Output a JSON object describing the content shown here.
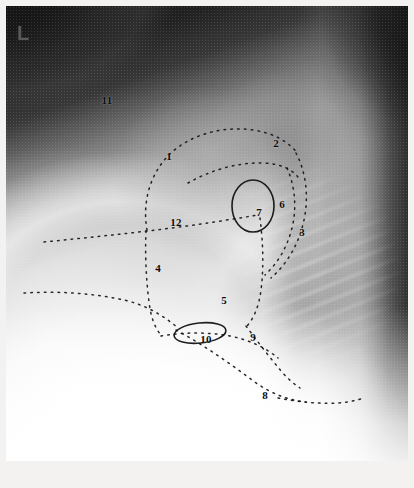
{
  "figure": {
    "modality": "radiograph",
    "view": "lateral chest",
    "side_marker": "L",
    "width": 414,
    "height": 488
  },
  "annotations": {
    "labels": [
      {
        "id": "label-1",
        "text": "1",
        "x": 163,
        "y": 150
      },
      {
        "id": "label-2",
        "text": "2",
        "x": 270,
        "y": 137
      },
      {
        "id": "label-3",
        "text": "3",
        "x": 296,
        "y": 226
      },
      {
        "id": "label-4",
        "text": "4",
        "x": 152,
        "y": 262
      },
      {
        "id": "label-5",
        "text": "5",
        "x": 218,
        "y": 294
      },
      {
        "id": "label-6",
        "text": "6",
        "x": 276,
        "y": 198
      },
      {
        "id": "label-7",
        "text": "7",
        "x": 253,
        "y": 206
      },
      {
        "id": "label-8",
        "text": "8",
        "x": 259,
        "y": 389
      },
      {
        "id": "label-9",
        "text": "9",
        "x": 247,
        "y": 331
      },
      {
        "id": "label-10",
        "text": "10",
        "x": 200,
        "y": 333
      },
      {
        "id": "label-11",
        "text": "11",
        "x": 101,
        "y": 94
      },
      {
        "id": "label-12",
        "text": "12",
        "x": 170,
        "y": 216
      }
    ],
    "ellipses": [
      {
        "id": "ellipse-7",
        "cx": 247,
        "cy": 200,
        "rx": 21,
        "ry": 26,
        "rotate": 0
      },
      {
        "id": "ellipse-10",
        "cx": 194,
        "cy": 327,
        "rx": 26,
        "ry": 10,
        "rotate": -6
      }
    ],
    "contours": [
      {
        "id": "contour-anterior-heart-border",
        "d": "M 141 224 C 136 196, 144 166, 166 146 C 188 127, 219 120, 247 124 C 268 127, 283 136, 292 148"
      },
      {
        "id": "contour-upper-inner-arc",
        "d": "M 182 177 C 205 164, 232 156, 258 157 C 276 158, 288 164, 294 174"
      },
      {
        "id": "contour-mid-horizontal",
        "d": "M 38 236 C 78 232, 118 228, 158 223 C 190 219, 222 214, 252 209"
      },
      {
        "id": "contour-posterior-heart-border",
        "d": "M 290 147 C 300 166, 303 190, 298 214 C 293 238, 281 258, 265 272"
      },
      {
        "id": "contour-inner-posterior",
        "d": "M 281 162 C 289 180, 291 202, 286 222 C 281 242, 271 258, 259 269"
      },
      {
        "id": "contour-left-vertical-descent",
        "d": "M 140 225 C 139 248, 140 272, 143 296 C 145 312, 149 322, 155 329"
      },
      {
        "id": "contour-right-vertical-descent",
        "d": "M 254 212 C 257 236, 258 260, 255 284 C 253 300, 248 312, 241 320"
      },
      {
        "id": "contour-lower-left-horizontal",
        "d": "M 18 287 C 52 285, 86 287, 118 294 C 140 299, 158 310, 172 322"
      },
      {
        "id": "contour-diaphragm-dome",
        "d": "M 155 330 C 178 326, 202 326, 224 330 C 244 334, 260 342, 272 352"
      },
      {
        "id": "contour-posterior-sulcus",
        "d": "M 240 320 C 252 336, 264 352, 276 366 C 282 373, 288 378, 294 382"
      },
      {
        "id": "contour-lower-diaphragm",
        "d": "M 170 324 C 196 338, 222 356, 246 374 C 262 386, 280 394, 300 396"
      },
      {
        "id": "contour-posterior-costophrenic",
        "d": "M 272 392 C 292 396, 312 398, 332 397 C 344 396, 352 394, 358 392"
      }
    ]
  }
}
